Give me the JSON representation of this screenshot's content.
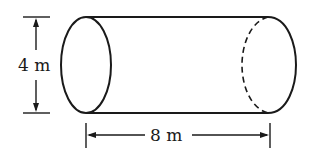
{
  "diagram": {
    "shape": "cylinder",
    "height_label": "4 m",
    "length_label": "8 m",
    "stroke_color": "#1a1a1a",
    "background": "#ffffff"
  }
}
